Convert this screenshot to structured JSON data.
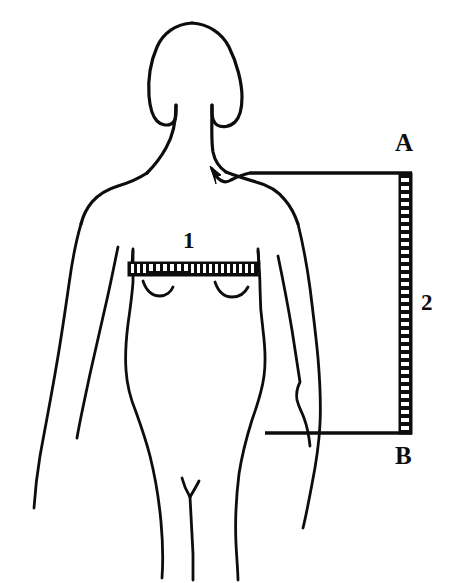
{
  "diagram": {
    "background_color": "#ffffff",
    "ink_color": "#0d0d0d",
    "labels": {
      "point_a": "A",
      "point_b": "B",
      "measure_one": "1",
      "measure_two": "2"
    },
    "measurements": [
      {
        "id": "1",
        "label": "1",
        "kind": "horizontal-tape-measure",
        "region": "bust",
        "orientation": "horizontal",
        "x_start": 128,
        "x_end": 258,
        "y": 262
      },
      {
        "id": "2",
        "label": "2",
        "kind": "vertical-tape-measure",
        "region": "shoulder-to-hip",
        "orientation": "vertical",
        "x": 399,
        "y_start": 173,
        "y_end": 433,
        "endpoint_top": "A",
        "endpoint_bottom": "B"
      }
    ],
    "guides": [
      {
        "id": "guide-a",
        "from_label": "A",
        "kind": "horizontal-guide-with-arrow",
        "y": 173,
        "x_start": 250,
        "x_end": 412,
        "arrow_target": "shoulder-neck-point"
      },
      {
        "id": "guide-b",
        "from_label": "B",
        "kind": "horizontal-guide",
        "y": 433,
        "x_start": 265,
        "x_end": 412,
        "arrow_target": null
      }
    ],
    "icons": {
      "arrow": "arrow-up-left-icon",
      "tape_horizontal": "tape-measure-horizontal-icon",
      "tape_vertical": "tape-measure-vertical-icon"
    }
  }
}
